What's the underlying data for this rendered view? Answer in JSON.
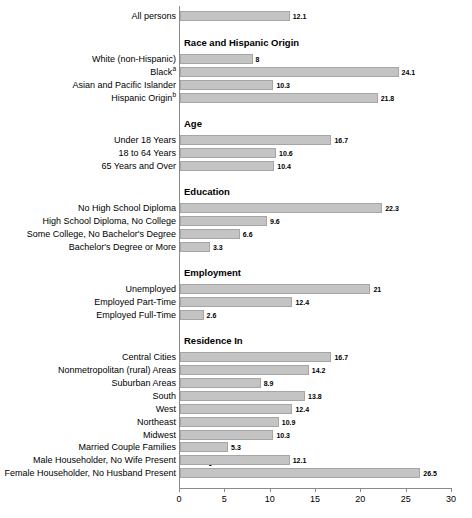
{
  "chart_data": {
    "type": "bar",
    "orientation": "horizontal",
    "title": "",
    "subtitle": "",
    "xlabel": "",
    "ylabel": "",
    "xlim": [
      0,
      30
    ],
    "xticks": [
      0,
      5,
      10,
      15,
      20,
      25,
      30
    ],
    "xtick_labels": [
      "0",
      "5",
      "10",
      "15",
      "20",
      "25",
      "30"
    ],
    "grid": false,
    "legend": false,
    "bar_color": "#c4c4c4",
    "bar_border_color": "#a6a6a6",
    "axis_color": "#8a8a8a",
    "categories": [
      "All persons",
      "White (non-Hispanic)",
      "Black",
      "Asian and Pacific Islander",
      "Hispanic Origin",
      "Under 18 Years",
      "18 to 64 Years",
      "65 Years and Over",
      "No High School Diploma",
      "High School Diploma, No College",
      "Some College, No Bachelor's Degree",
      "Bachelor's Degree or More",
      "Unemployed",
      "Employed Part-Time",
      "Employed Full-Time",
      "Central Cities",
      "Nonmetropolitan (rural) Areas",
      "Suburban Areas",
      "South",
      "West",
      "Northeast",
      "Midwest",
      "Married Couple Families",
      "Male Householder, No Wife Present",
      "Female Householder, No Husband Present"
    ],
    "values": [
      12.1,
      8,
      24.1,
      10.3,
      21.8,
      16.7,
      10.6,
      10.4,
      22.3,
      9.6,
      6.6,
      3.3,
      21,
      12.4,
      2.6,
      16.7,
      14.2,
      8.9,
      13.8,
      12.4,
      10.9,
      10.3,
      5.3,
      12.1,
      26.5
    ],
    "section_headings": [
      "Race and Hispanic Origin",
      "Age",
      "Education",
      "Employment",
      "Residence In",
      "Family Status"
    ]
  },
  "rows": [
    {
      "label": "All persons",
      "sup": "",
      "value": 12.1,
      "value_label": "12.1",
      "y": 11
    },
    {
      "heading": "Race and Hispanic Origin",
      "y": 37
    },
    {
      "label": "White (non-Hispanic)",
      "sup": "",
      "value": 8,
      "value_label": "8",
      "y": 54
    },
    {
      "label": "Black",
      "sup": "a",
      "value": 24.1,
      "value_label": "24.1",
      "y": 67
    },
    {
      "label": "Asian and Pacific Islander",
      "sup": "",
      "value": 10.3,
      "value_label": "10.3",
      "y": 80
    },
    {
      "label": "Hispanic Origin",
      "sup": "b",
      "value": 21.8,
      "value_label": "21.8",
      "y": 93
    },
    {
      "heading": "Age",
      "y": 118
    },
    {
      "label": "Under 18 Years",
      "sup": "",
      "value": 16.7,
      "value_label": "16.7",
      "y": 135
    },
    {
      "label": "18 to 64 Years",
      "sup": "",
      "value": 10.6,
      "value_label": "10.6",
      "y": 148
    },
    {
      "label": "65 Years and Over",
      "sup": "",
      "value": 10.4,
      "value_label": "10.4",
      "y": 161
    },
    {
      "heading": "Education",
      "y": 186
    },
    {
      "label": "No High School Diploma",
      "sup": "",
      "value": 22.3,
      "value_label": "22.3",
      "y": 203
    },
    {
      "label": "High School Diploma, No College",
      "sup": "",
      "value": 9.6,
      "value_label": "9.6",
      "y": 216
    },
    {
      "label": "Some College, No Bachelor's Degree",
      "sup": "",
      "value": 6.6,
      "value_label": "6.6",
      "y": 229
    },
    {
      "label": "Bachelor's Degree or More",
      "sup": "",
      "value": 3.3,
      "value_label": "3.3",
      "y": 242
    },
    {
      "heading": "Employment",
      "y": 267
    },
    {
      "label": "Unemployed",
      "sup": "",
      "value": 21,
      "value_label": "21",
      "y": 284
    },
    {
      "label": "Employed Part-Time",
      "sup": "",
      "value": 12.4,
      "value_label": "12.4",
      "y": 297
    },
    {
      "label": "Employed Full-Time",
      "sup": "",
      "value": 2.6,
      "value_label": "2.6",
      "y": 310
    },
    {
      "heading": "Residence In",
      "y": 335
    },
    {
      "label": "Central Cities",
      "sup": "",
      "value": 16.7,
      "value_label": "16.7",
      "y": 352
    },
    {
      "label": "Nonmetropolitan (rural) Areas",
      "sup": "",
      "value": 14.2,
      "value_label": "14.2",
      "y": 365
    },
    {
      "label": "Suburban Areas",
      "sup": "",
      "value": 8.9,
      "value_label": "8.9",
      "y": 378
    },
    {
      "label": "South",
      "sup": "",
      "value": 13.8,
      "value_label": "13.8",
      "y": 391
    },
    {
      "label": "West",
      "sup": "",
      "value": 12.4,
      "value_label": "12.4",
      "y": 404
    },
    {
      "label": "Northeast",
      "sup": "",
      "value": 10.9,
      "value_label": "10.9",
      "y": 417
    },
    {
      "label": "Midwest",
      "sup": "",
      "value": 10.3,
      "value_label": "10.3",
      "y": 430
    },
    {
      "heading": "Family Status",
      "y": 455
    },
    {
      "label": "Married Couple Families",
      "sup": "",
      "value": 5.3,
      "value_label": "5.3",
      "y": 442
    },
    {
      "label": "Male Householder, No Wife Present",
      "sup": "",
      "value": 12.1,
      "value_label": "12.1",
      "y": 455
    },
    {
      "label": "Female Householder, No Husband Present",
      "sup": "",
      "value": 26.5,
      "value_label": "26.5",
      "y": 468
    }
  ],
  "axis": {
    "tick_labels": [
      "0",
      "5",
      "10",
      "15",
      "20",
      "25",
      "30"
    ],
    "min": 0,
    "max": 30
  }
}
